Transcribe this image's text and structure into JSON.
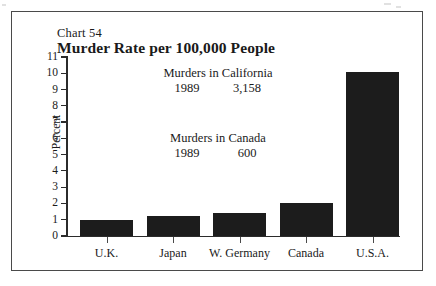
{
  "figure": {
    "chart_number": "Chart 54",
    "title": "Murder Rate per 100,000 People"
  },
  "annotations": {
    "california": {
      "heading": "Murders in California",
      "year": "1989",
      "value": "3,158"
    },
    "canada": {
      "heading": "Murders in Canada",
      "year": "1989",
      "value": "600"
    }
  },
  "axes": {
    "y_title": "Percent",
    "y_ticks": [
      "11",
      "10",
      "9",
      "8",
      "7",
      "6",
      "5",
      "4",
      "3",
      "2",
      "1",
      "0"
    ]
  },
  "colors": {
    "bar": "#1c1c1c",
    "axis": "#2b2b2b",
    "frame": "#4a4a4a",
    "background": "#ffffff"
  },
  "chart_data": {
    "type": "bar",
    "title": "Murder Rate per 100,000 People",
    "xlabel": "",
    "ylabel": "Percent",
    "ylim": [
      0,
      11
    ],
    "ytick_step": 1,
    "grid": false,
    "legend": false,
    "categories": [
      "U.K.",
      "Japan",
      "W. Germany",
      "Canada",
      "U.S.A."
    ],
    "values": [
      1.0,
      1.2,
      1.4,
      2.0,
      10.1
    ],
    "annotations": [
      "Murders in California  1989  3,158",
      "Murders in Canada  1989  600"
    ]
  }
}
